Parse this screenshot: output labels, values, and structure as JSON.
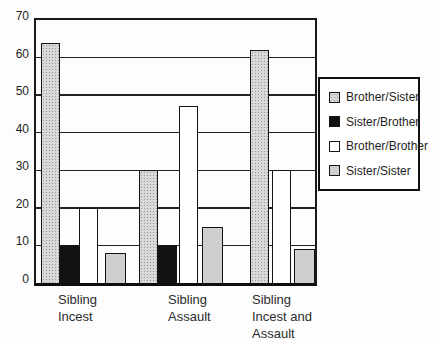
{
  "figure": {
    "background_color": "#fdfdfd",
    "axis_color": "#1a1a1a",
    "title": ""
  },
  "chart_data": {
    "type": "bar",
    "title": "",
    "xlabel": "",
    "ylabel": "",
    "categories": [
      "Sibling Incest",
      "Sibling Assault",
      "Sibling Incest and Assault"
    ],
    "category_label_lines": [
      [
        "Sibling",
        "Incest"
      ],
      [
        "Sibling",
        "Assault"
      ],
      [
        "Sibling",
        "Incest and",
        "Assault"
      ]
    ],
    "series": [
      {
        "name": "Brother/Sister",
        "values": [
          64,
          30,
          62
        ],
        "fill": "#d8d8d8",
        "pattern": "stipple"
      },
      {
        "name": "Sister/Brother",
        "values": [
          10,
          10,
          0
        ],
        "fill": "#121212",
        "pattern": "solid"
      },
      {
        "name": "Brother/Brother",
        "values": [
          20,
          47,
          30
        ],
        "fill": "#ffffff",
        "pattern": "solid"
      },
      {
        "name": "Sister/Sister",
        "values": [
          8,
          15,
          9
        ],
        "fill": "#cfcfcf",
        "pattern": "solid"
      }
    ],
    "ylim": [
      0,
      70
    ],
    "yticks": [
      0,
      10,
      20,
      30,
      40,
      50,
      60,
      70
    ],
    "ytick_step": 10,
    "grid": "horizontal",
    "gridline_color": "#222222",
    "legend_position": "right",
    "legend_items": [
      "Brother/Sister",
      "Sister/Brother",
      "Brother/Brother",
      "Sister/Sister"
    ]
  }
}
